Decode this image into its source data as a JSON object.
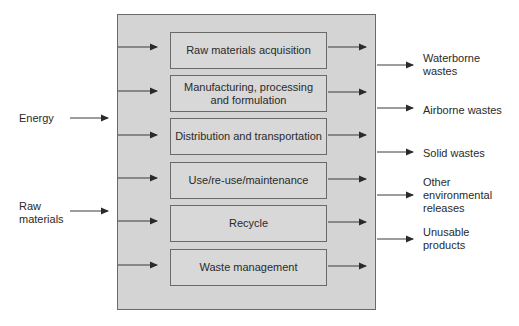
{
  "diagram": {
    "type": "life-cycle-flow",
    "inputs": [
      {
        "label": "Energy"
      },
      {
        "label": "Raw\nmaterials"
      }
    ],
    "stages": [
      {
        "label": "Raw materials acquisition"
      },
      {
        "label": "Manufacturing, processing and formulation"
      },
      {
        "label": "Distribution and transportation"
      },
      {
        "label": "Use/re-use/maintenance"
      },
      {
        "label": "Recycle"
      },
      {
        "label": "Waste management"
      }
    ],
    "outputs": [
      {
        "label": "Waterborne wastes"
      },
      {
        "label": "Airborne wastes"
      },
      {
        "label": "Solid wastes"
      },
      {
        "label": "Other environmental releases"
      },
      {
        "label": "Unusable products"
      }
    ],
    "colors": {
      "system_fill": "#d4d4d4",
      "stage_fill": "#d8d8d8",
      "border": "#6a6a6a",
      "arrow": "#2a2a2a"
    }
  }
}
